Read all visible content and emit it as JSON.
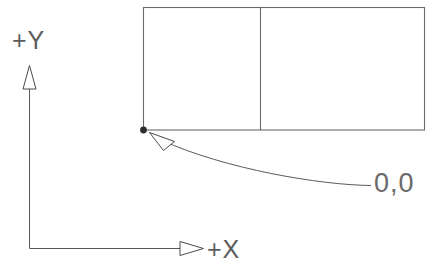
{
  "diagram": {
    "background_color": "#ffffff",
    "line_color": "#5a5a5a",
    "text_color": "#5c5c5c",
    "labels": {
      "y_axis": "+Y",
      "x_axis": "+X",
      "origin": "0,0"
    },
    "axes": {
      "origin_corner": {
        "x": 29,
        "y": 248
      },
      "y_axis_top": {
        "x": 29,
        "y": 66
      },
      "x_axis_right": {
        "x": 203,
        "y": 248
      },
      "y_arrow_name": "y-axis-arrowhead",
      "x_arrow_name": "x-axis-arrowhead"
    },
    "shape": {
      "name": "rectangle-with-divider",
      "left": 143,
      "top": 7,
      "right": 425,
      "bottom": 130,
      "divider_x": 260
    },
    "origin_marker": {
      "name": "origin-point",
      "x": 143,
      "y": 130,
      "radius": 3.4
    },
    "leader": {
      "name": "origin-leader-line",
      "arrow_tip": {
        "x": 150,
        "y": 133
      },
      "end": {
        "x": 371,
        "y": 185
      }
    }
  }
}
